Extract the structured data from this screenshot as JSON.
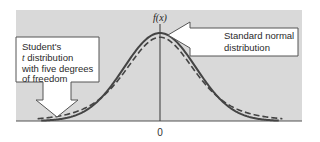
{
  "figure": {
    "y_axis_label": "f(x)",
    "x_tick_label": "0",
    "callouts": {
      "normal": {
        "line1": "Standard normal",
        "line2": "distribution"
      },
      "t": {
        "line1": "Student's",
        "line2_italic": "t",
        "line2_rest": " distribution",
        "line3": "with five degrees",
        "line4": "of freedom"
      }
    },
    "colors": {
      "panel": "#d9d9d9",
      "curve": "#444444",
      "callout_fill": "#ffffff",
      "callout_stroke": "#555555"
    }
  },
  "chart_data": {
    "type": "line",
    "title": "",
    "xlabel": "",
    "ylabel": "f(x)",
    "x_ticks": [
      "0"
    ],
    "series": [
      {
        "name": "Standard normal distribution",
        "style": "solid",
        "distribution": "N(0,1)"
      },
      {
        "name": "Student's t distribution with five degrees of freedom",
        "style": "dashed",
        "distribution": "t(5)"
      }
    ],
    "annotations": [
      "Standard normal distribution",
      "Student's t distribution with five degrees of freedom"
    ],
    "grid": false
  }
}
